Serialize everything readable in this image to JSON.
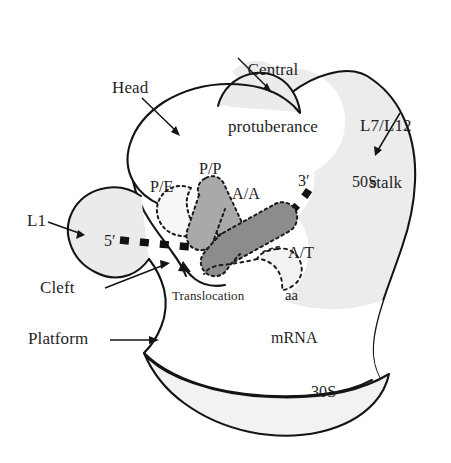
{
  "figure": {
    "subunits": [
      {
        "key": "large",
        "label": "50S",
        "fill": "#ebebeb"
      },
      {
        "key": "small",
        "label": "30S",
        "fill": "#ffffff"
      }
    ]
  },
  "labels": {
    "central_protuberance_line1": "Central",
    "central_protuberance_line2": "protuberance",
    "head": "Head",
    "l7_l12_line1": "L7/L12",
    "l7_l12_line2": "stalk",
    "fifty_s": "50S",
    "thirty_s": "30S",
    "l1": "L1",
    "cleft": "Cleft",
    "platform": "Platform",
    "mrna": "mRNA",
    "five_prime": "5′",
    "three_prime": "3′",
    "site_pe": "P/E",
    "site_pp": "P/P",
    "site_aa_site": "A/A",
    "site_at": "A/T",
    "aa": "aa",
    "translocation": "Translocation"
  },
  "sites": [
    {
      "name": "P/E",
      "fill": "#f7f7f7",
      "outline": "dotted",
      "description": "hybrid P/E tRNA site"
    },
    {
      "name": "P/P",
      "fill": "#a9a9a9",
      "outline": "dotted",
      "description": "classical P site tRNA"
    },
    {
      "name": "A/A",
      "fill": "#8c8c8c",
      "outline": "dotted",
      "description": "classical A site tRNA"
    },
    {
      "name": "A/T",
      "fill": "#f2f2f2",
      "outline": "dashed",
      "description": "A/T ternary complex site"
    }
  ],
  "colors": {
    "outline": "#141414",
    "subunit_50s_fill": "#ebebeb",
    "subunit_30s_fill": "#ffffff",
    "trna_pp": "#a9a9a9",
    "trna_aa": "#8c8c8c",
    "trna_pe": "#f7f7f7",
    "trna_at": "#f2f2f2",
    "mrna_dash": "#111111",
    "text": "#1f1f1f",
    "background": "#ffffff"
  }
}
